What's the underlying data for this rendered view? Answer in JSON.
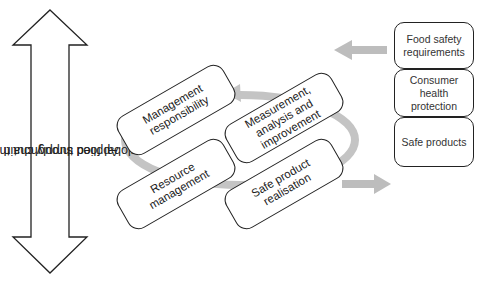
{
  "side_arrow": {
    "label_line1": "Applied throughout the",
    "label_line2": "global food supply chain"
  },
  "cycle_boxes": [
    {
      "label": "Management responsibility"
    },
    {
      "label": "Measurement, analysis and improvement"
    },
    {
      "label": "Resource management"
    },
    {
      "label": "Safe product realisation"
    }
  ],
  "stack_boxes": [
    {
      "label": "Food safety requirements"
    },
    {
      "label": "Consumer health protection"
    },
    {
      "label": "Safe products"
    }
  ],
  "colors": {
    "outline": "#222222",
    "arrow_gray": "#bdbdbd",
    "background": "#ffffff"
  }
}
